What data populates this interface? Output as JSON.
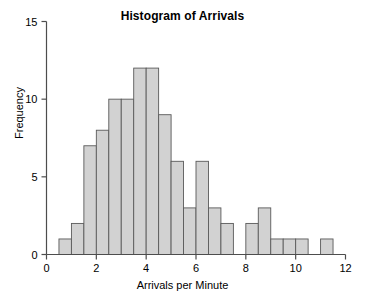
{
  "chart_data": {
    "type": "bar",
    "title": "Histogram of Arrivals",
    "xlabel": "Arrivals per Minute",
    "ylabel": "Frequency",
    "xlim": [
      0,
      12
    ],
    "ylim": [
      0,
      15
    ],
    "xticks": [
      0,
      2,
      4,
      6,
      8,
      10,
      12
    ],
    "xtick_labels": [
      "0",
      "2",
      "4",
      "6",
      "8",
      "10",
      "12"
    ],
    "yticks": [
      0,
      5,
      10,
      15
    ],
    "ytick_labels": [
      "0",
      "5",
      "10",
      "15"
    ],
    "grid": false,
    "legend": null,
    "bin_width": 0.5,
    "bin_edges": [
      0.5,
      1.0,
      1.5,
      2.0,
      2.5,
      3.0,
      3.5,
      4.0,
      4.5,
      5.0,
      5.5,
      6.0,
      6.5,
      7.0,
      7.5,
      8.0,
      8.5,
      9.0,
      9.5,
      10.0,
      10.5,
      11.0,
      11.5
    ],
    "categories": [
      "0.5-1.0",
      "1.0-1.5",
      "1.5-2.0",
      "2.0-2.5",
      "2.5-3.0",
      "3.0-3.5",
      "3.5-4.0",
      "4.0-4.5",
      "4.5-5.0",
      "5.0-5.5",
      "5.5-6.0",
      "6.0-6.5",
      "6.5-7.0",
      "7.0-7.5",
      "7.5-8.0",
      "8.0-8.5",
      "8.5-9.0",
      "9.0-9.5",
      "9.5-10.0",
      "10.0-10.5",
      "10.5-11.0",
      "11.0-11.5"
    ],
    "values": [
      1,
      2,
      7,
      8,
      10,
      10,
      12,
      12,
      9,
      6,
      3,
      6,
      3,
      2,
      0,
      2,
      3,
      1,
      1,
      1,
      0,
      1
    ],
    "bar_fill_color": "#d2d2d2",
    "bar_edge_color": "#5a5a5a",
    "axis_color": "#4d4d4d"
  }
}
